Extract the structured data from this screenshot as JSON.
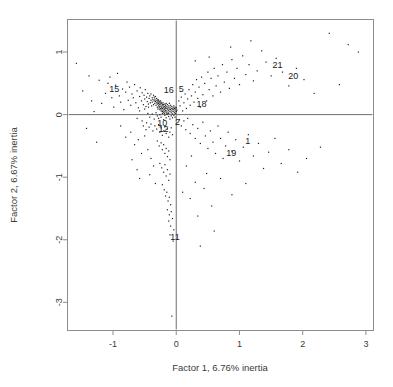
{
  "figure": {
    "type": "scatter",
    "background": "#ffffff",
    "point_color": "#222222",
    "frame_color": "#8d8d8d",
    "refline_color": "#6f6f6f"
  },
  "chart_data": {
    "type": "scatter",
    "title": "",
    "subtitle": "",
    "xlabel": "Factor 1, 6.76% inertia",
    "ylabel": "Factor 2, 6.67% inertia",
    "xlim": [
      -1.72,
      3.12
    ],
    "ylim": [
      -3.45,
      1.52
    ],
    "xticks": [
      -1,
      0,
      1,
      2,
      3
    ],
    "xticklabels": [
      "-1",
      "0",
      "1",
      "2",
      "3"
    ],
    "yticks": [
      1,
      0,
      -1,
      -2,
      -3
    ],
    "yticklabels": [
      "1",
      "0",
      "-1",
      "-2",
      "-3"
    ],
    "grid": false,
    "legend": null,
    "reference_lines": [
      {
        "orientation": "horizontal",
        "value": 0
      },
      {
        "orientation": "vertical",
        "value": 0
      }
    ],
    "annotations": [
      {
        "label": "15",
        "x": -0.98,
        "y": 0.42
      },
      {
        "label": "16",
        "x": -0.12,
        "y": 0.4
      },
      {
        "label": "5",
        "x": 0.08,
        "y": 0.42
      },
      {
        "label": "18",
        "x": 0.4,
        "y": 0.17
      },
      {
        "label": "10",
        "x": -0.22,
        "y": -0.13
      },
      {
        "label": "12",
        "x": -0.2,
        "y": -0.22
      },
      {
        "label": "2",
        "x": 0.02,
        "y": -0.12
      },
      {
        "label": "11",
        "x": -0.02,
        "y": -1.95
      },
      {
        "label": "19",
        "x": 0.87,
        "y": -0.61
      },
      {
        "label": "1",
        "x": 1.13,
        "y": -0.42
      },
      {
        "label": "21",
        "x": 1.6,
        "y": 0.79
      },
      {
        "label": "20",
        "x": 1.85,
        "y": 0.62
      }
    ],
    "points": [
      [
        -1.58,
        0.82
      ],
      [
        -1.3,
        0.05
      ],
      [
        -1.22,
        0.55
      ],
      [
        -1.18,
        0.18
      ],
      [
        -1.12,
        0.34
      ],
      [
        -1.08,
        0.5
      ],
      [
        -1.05,
        0.6
      ],
      [
        -1.02,
        0.27
      ],
      [
        -0.99,
        0.12
      ],
      [
        -0.96,
        0.47
      ],
      [
        -0.93,
        0.66
      ],
      [
        -0.9,
        0.3
      ],
      [
        -0.88,
        0.2
      ],
      [
        -0.85,
        0.41
      ],
      [
        -0.83,
        0.08
      ],
      [
        -0.8,
        0.36
      ],
      [
        -0.78,
        0.52
      ],
      [
        -0.76,
        0.23
      ],
      [
        -0.74,
        0.44
      ],
      [
        -0.72,
        0.15
      ],
      [
        -0.7,
        0.33
      ],
      [
        -0.68,
        0.27
      ],
      [
        -0.66,
        0.48
      ],
      [
        -0.64,
        0.19
      ],
      [
        -0.62,
        0.38
      ],
      [
        -0.6,
        0.11
      ],
      [
        -0.58,
        0.29
      ],
      [
        -0.57,
        0.43
      ],
      [
        -0.55,
        0.22
      ],
      [
        -0.54,
        0.35
      ],
      [
        -0.52,
        0.16
      ],
      [
        -0.51,
        0.31
      ],
      [
        -0.5,
        0.25
      ],
      [
        -0.49,
        0.4
      ],
      [
        -0.48,
        0.13
      ],
      [
        -0.47,
        0.28
      ],
      [
        -0.46,
        0.21
      ],
      [
        -0.45,
        0.34
      ],
      [
        -0.44,
        0.17
      ],
      [
        -0.43,
        0.26
      ],
      [
        -0.42,
        0.3
      ],
      [
        -0.41,
        0.19
      ],
      [
        -0.4,
        0.23
      ],
      [
        -0.4,
        0.33
      ],
      [
        -0.39,
        0.14
      ],
      [
        -0.38,
        0.27
      ],
      [
        -0.38,
        0.2
      ],
      [
        -0.37,
        0.24
      ],
      [
        -0.36,
        0.31
      ],
      [
        -0.36,
        0.16
      ],
      [
        -0.35,
        0.22
      ],
      [
        -0.35,
        0.28
      ],
      [
        -0.34,
        0.18
      ],
      [
        -0.34,
        0.25
      ],
      [
        -0.33,
        0.21
      ],
      [
        -0.33,
        0.29
      ],
      [
        -0.32,
        0.15
      ],
      [
        -0.32,
        0.23
      ],
      [
        -0.31,
        0.19
      ],
      [
        -0.31,
        0.26
      ],
      [
        -0.3,
        0.12
      ],
      [
        -0.3,
        0.22
      ],
      [
        -0.3,
        0.17
      ],
      [
        -0.29,
        0.24
      ],
      [
        -0.29,
        0.09
      ],
      [
        -0.29,
        0.2
      ],
      [
        -0.28,
        0.14
      ],
      [
        -0.28,
        0.23
      ],
      [
        -0.28,
        0.18
      ],
      [
        -0.27,
        0.11
      ],
      [
        -0.27,
        0.21
      ],
      [
        -0.27,
        0.16
      ],
      [
        -0.26,
        0.08
      ],
      [
        -0.26,
        0.19
      ],
      [
        -0.26,
        0.13
      ],
      [
        -0.25,
        0.22
      ],
      [
        -0.25,
        0.1
      ],
      [
        -0.25,
        0.17
      ],
      [
        -0.24,
        0.06
      ],
      [
        -0.24,
        0.2
      ],
      [
        -0.24,
        0.14
      ],
      [
        -0.23,
        0.09
      ],
      [
        -0.23,
        0.18
      ],
      [
        -0.23,
        0.12
      ],
      [
        -0.22,
        0.05
      ],
      [
        -0.22,
        0.16
      ],
      [
        -0.22,
        0.1
      ],
      [
        -0.21,
        0.14
      ],
      [
        -0.21,
        0.07
      ],
      [
        -0.21,
        0.19
      ],
      [
        -0.2,
        0.11
      ],
      [
        -0.2,
        0.04
      ],
      [
        -0.2,
        0.16
      ],
      [
        -0.19,
        0.08
      ],
      [
        -0.19,
        0.13
      ],
      [
        -0.19,
        0.02
      ],
      [
        -0.18,
        0.1
      ],
      [
        -0.18,
        0.17
      ],
      [
        -0.18,
        0.05
      ],
      [
        -0.17,
        0.12
      ],
      [
        -0.17,
        0.07
      ],
      [
        -0.17,
        0.15
      ],
      [
        -0.16,
        0.03
      ],
      [
        -0.16,
        0.1
      ],
      [
        -0.16,
        0.18
      ],
      [
        -0.15,
        0.06
      ],
      [
        -0.15,
        0.13
      ],
      [
        -0.15,
        0.01
      ],
      [
        -0.14,
        0.09
      ],
      [
        -0.14,
        0.16
      ],
      [
        -0.13,
        0.04
      ],
      [
        -0.13,
        0.11
      ],
      [
        -0.12,
        0.07
      ],
      [
        -0.12,
        0.14
      ],
      [
        -0.12,
        0.02
      ],
      [
        -0.11,
        0.09
      ],
      [
        -0.11,
        0.18
      ],
      [
        -0.1,
        0.05
      ],
      [
        -0.1,
        0.12
      ],
      [
        -0.09,
        0.08
      ],
      [
        -0.09,
        0.15
      ],
      [
        -0.08,
        0.03
      ],
      [
        -0.08,
        0.1
      ],
      [
        -0.07,
        0.06
      ],
      [
        -0.07,
        0.13
      ],
      [
        -0.06,
        0.09
      ],
      [
        -0.06,
        0.01
      ],
      [
        -0.05,
        0.11
      ],
      [
        -0.05,
        0.05
      ],
      [
        -0.04,
        0.08
      ],
      [
        -0.04,
        0.14
      ],
      [
        -0.03,
        0.03
      ],
      [
        -0.03,
        0.1
      ],
      [
        -0.02,
        0.06
      ],
      [
        -0.02,
        0.12
      ],
      [
        -0.01,
        0.02
      ],
      [
        -0.01,
        0.09
      ],
      [
        0.0,
        0.05
      ],
      [
        0.0,
        0.11
      ],
      [
        0.01,
        0.07
      ],
      [
        -0.45,
        0.02
      ],
      [
        -0.42,
        -0.04
      ],
      [
        -0.38,
        0.01
      ],
      [
        -0.35,
        -0.07
      ],
      [
        -0.32,
        0.03
      ],
      [
        -0.3,
        -0.02
      ],
      [
        -0.28,
        -0.06
      ],
      [
        -0.26,
        0.0
      ],
      [
        -0.24,
        -0.04
      ],
      [
        -0.22,
        0.02
      ],
      [
        -0.2,
        -0.08
      ],
      [
        -0.18,
        -0.01
      ],
      [
        -0.16,
        -0.05
      ],
      [
        -0.14,
        0.01
      ],
      [
        -0.12,
        -0.03
      ],
      [
        -0.1,
        -0.07
      ],
      [
        -0.08,
        -0.02
      ],
      [
        -0.06,
        -0.05
      ],
      [
        -0.04,
        -0.01
      ],
      [
        -0.02,
        -0.04
      ],
      [
        -0.62,
        -0.06
      ],
      [
        -0.58,
        0.06
      ],
      [
        -0.54,
        -0.1
      ],
      [
        -0.5,
        0.09
      ],
      [
        -0.47,
        -0.13
      ],
      [
        -0.44,
        0.12
      ],
      [
        -0.52,
        -0.18
      ],
      [
        -0.48,
        -0.24
      ],
      [
        -0.43,
        -0.2
      ],
      [
        -0.4,
        -0.15
      ],
      [
        -0.37,
        -0.26
      ],
      [
        -0.34,
        -0.18
      ],
      [
        -0.31,
        -0.23
      ],
      [
        -0.28,
        -0.16
      ],
      [
        -0.26,
        -0.28
      ],
      [
        -0.24,
        -0.21
      ],
      [
        -0.22,
        -0.33
      ],
      [
        -0.2,
        -0.26
      ],
      [
        -0.18,
        -0.19
      ],
      [
        -0.16,
        -0.3
      ],
      [
        -0.14,
        -0.23
      ],
      [
        -0.12,
        -0.36
      ],
      [
        -0.1,
        -0.28
      ],
      [
        -0.08,
        -0.21
      ],
      [
        -0.06,
        -0.32
      ],
      [
        -0.3,
        -0.42
      ],
      [
        -0.27,
        -0.5
      ],
      [
        -0.24,
        -0.45
      ],
      [
        -0.22,
        -0.56
      ],
      [
        -0.2,
        -0.48
      ],
      [
        -0.18,
        -0.62
      ],
      [
        -0.16,
        -0.54
      ],
      [
        -0.14,
        -0.67
      ],
      [
        -0.12,
        -0.58
      ],
      [
        -0.1,
        -0.72
      ],
      [
        -0.26,
        -0.78
      ],
      [
        -0.23,
        -0.85
      ],
      [
        -0.2,
        -0.92
      ],
      [
        -0.18,
        -0.8
      ],
      [
        -0.16,
        -0.98
      ],
      [
        -0.14,
        -0.88
      ],
      [
        -0.12,
        -1.05
      ],
      [
        -0.1,
        -0.95
      ],
      [
        -0.22,
        -1.12
      ],
      [
        -0.19,
        -1.2
      ],
      [
        -0.17,
        -1.3
      ],
      [
        -0.15,
        -1.24
      ],
      [
        -0.13,
        -1.38
      ],
      [
        -0.11,
        -1.32
      ],
      [
        -0.09,
        -1.44
      ],
      [
        -0.14,
        -1.52
      ],
      [
        -0.11,
        -1.6
      ],
      [
        -0.08,
        -1.55
      ],
      [
        -0.12,
        -1.7
      ],
      [
        -0.09,
        -1.78
      ],
      [
        -0.06,
        -1.66
      ],
      [
        -0.04,
        -1.84
      ],
      [
        -0.1,
        -1.92
      ],
      [
        -0.05,
        -2.02
      ],
      [
        -0.07,
        -3.22
      ],
      [
        -0.88,
        -0.18
      ],
      [
        -0.8,
        -0.36
      ],
      [
        -0.72,
        -0.28
      ],
      [
        -0.66,
        -0.48
      ],
      [
        -0.6,
        -0.4
      ],
      [
        -0.55,
        -0.62
      ],
      [
        -0.7,
        -0.72
      ],
      [
        -0.62,
        -0.88
      ],
      [
        -0.5,
        -0.34
      ],
      [
        -0.58,
        -1.02
      ],
      [
        -0.45,
        -0.56
      ],
      [
        -0.4,
        -0.7
      ],
      [
        -0.36,
        -0.82
      ],
      [
        -0.42,
        -0.96
      ],
      [
        -0.33,
        -1.1
      ],
      [
        0.04,
        0.22
      ],
      [
        0.06,
        0.14
      ],
      [
        0.08,
        0.28
      ],
      [
        0.1,
        0.06
      ],
      [
        0.12,
        0.19
      ],
      [
        0.14,
        0.33
      ],
      [
        0.16,
        0.1
      ],
      [
        0.18,
        0.25
      ],
      [
        0.2,
        0.4
      ],
      [
        0.22,
        0.15
      ],
      [
        0.24,
        0.3
      ],
      [
        0.26,
        0.48
      ],
      [
        0.28,
        0.2
      ],
      [
        0.3,
        0.36
      ],
      [
        0.32,
        0.56
      ],
      [
        0.34,
        0.26
      ],
      [
        0.36,
        0.44
      ],
      [
        0.38,
        0.12
      ],
      [
        0.4,
        0.6
      ],
      [
        0.42,
        0.32
      ],
      [
        0.45,
        0.5
      ],
      [
        0.48,
        0.22
      ],
      [
        0.5,
        0.68
      ],
      [
        0.52,
        0.4
      ],
      [
        0.55,
        0.58
      ],
      [
        0.58,
        0.3
      ],
      [
        0.6,
        0.74
      ],
      [
        0.63,
        0.46
      ],
      [
        0.66,
        0.62
      ],
      [
        0.7,
        0.36
      ],
      [
        0.73,
        0.8
      ],
      [
        0.76,
        0.52
      ],
      [
        0.8,
        0.68
      ],
      [
        0.84,
        0.42
      ],
      [
        0.88,
        0.88
      ],
      [
        0.92,
        0.58
      ],
      [
        0.96,
        0.74
      ],
      [
        1.0,
        0.48
      ],
      [
        1.05,
        0.94
      ],
      [
        1.1,
        0.64
      ],
      [
        1.15,
        0.8
      ],
      [
        1.22,
        0.54
      ],
      [
        1.28,
        0.7
      ],
      [
        1.35,
        1.02
      ],
      [
        1.42,
        0.84
      ],
      [
        1.5,
        0.62
      ],
      [
        1.58,
        0.9
      ],
      [
        1.68,
        0.68
      ],
      [
        1.78,
        0.46
      ],
      [
        1.9,
        0.74
      ],
      [
        2.02,
        0.56
      ],
      [
        2.18,
        0.34
      ],
      [
        2.42,
        1.3
      ],
      [
        2.58,
        0.48
      ],
      [
        2.72,
        1.12
      ],
      [
        2.88,
        1.0
      ],
      [
        1.18,
        1.18
      ],
      [
        0.86,
        1.08
      ],
      [
        0.52,
        0.92
      ],
      [
        0.3,
        0.86
      ],
      [
        0.05,
        -0.08
      ],
      [
        0.08,
        -0.18
      ],
      [
        0.12,
        -0.1
      ],
      [
        0.15,
        -0.24
      ],
      [
        0.18,
        -0.06
      ],
      [
        0.22,
        -0.3
      ],
      [
        0.26,
        -0.16
      ],
      [
        0.3,
        -0.38
      ],
      [
        0.34,
        -0.22
      ],
      [
        0.38,
        -0.46
      ],
      [
        0.42,
        -0.12
      ],
      [
        0.46,
        -0.34
      ],
      [
        0.5,
        -0.54
      ],
      [
        0.54,
        -0.26
      ],
      [
        0.58,
        -0.44
      ],
      [
        0.62,
        -0.62
      ],
      [
        0.66,
        -0.18
      ],
      [
        0.7,
        -0.38
      ],
      [
        0.74,
        -0.7
      ],
      [
        0.78,
        -0.5
      ],
      [
        0.82,
        -0.28
      ],
      [
        0.88,
        -0.58
      ],
      [
        0.94,
        -0.4
      ],
      [
        1.0,
        -0.74
      ],
      [
        1.06,
        -0.52
      ],
      [
        1.14,
        -0.32
      ],
      [
        1.22,
        -0.66
      ],
      [
        1.3,
        -0.46
      ],
      [
        1.38,
        -0.86
      ],
      [
        1.46,
        -0.6
      ],
      [
        1.56,
        -0.38
      ],
      [
        1.66,
        -0.78
      ],
      [
        1.78,
        -0.56
      ],
      [
        1.92,
        -0.92
      ],
      [
        2.06,
        -0.7
      ],
      [
        2.28,
        -0.52
      ],
      [
        0.7,
        -1.02
      ],
      [
        0.44,
        -1.18
      ],
      [
        0.22,
        -1.34
      ],
      [
        0.56,
        -1.46
      ],
      [
        0.34,
        -1.62
      ],
      [
        0.88,
        -1.28
      ],
      [
        0.6,
        -1.86
      ],
      [
        0.38,
        -2.1
      ],
      [
        0.3,
        -1.08
      ],
      [
        0.16,
        -0.82
      ],
      [
        0.48,
        -0.94
      ],
      [
        0.24,
        -0.66
      ],
      [
        0.1,
        -1.24
      ],
      [
        1.1,
        -1.1
      ],
      [
        -1.48,
        0.38
      ],
      [
        -1.38,
        0.62
      ],
      [
        -1.42,
        -0.22
      ],
      [
        -1.26,
        -0.44
      ],
      [
        -1.34,
        0.22
      ]
    ]
  }
}
